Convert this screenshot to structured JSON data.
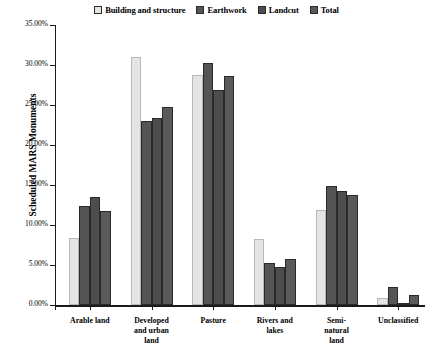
{
  "chart_data": {
    "type": "bar",
    "title": "",
    "subtitle": "",
    "xlabel": "",
    "ylabel": "Scheduled MARS Monuments",
    "ylim": [
      0,
      35
    ],
    "grid": false,
    "legend_position": "top-center",
    "y_tick_labels": [
      "0.00%",
      "5.00%",
      "10.00%",
      "15.00%",
      "20.00%",
      "25.00%",
      "30.00%",
      "35.00%"
    ],
    "y_tick_values": [
      0,
      5,
      10,
      15,
      20,
      25,
      30,
      35
    ],
    "categories": [
      "Arable land",
      "Developed and urban land",
      "Pasture",
      "Rivers and lakes",
      "Semi-natural land",
      "Unclassified"
    ],
    "category_lines": [
      [
        "Arable land"
      ],
      [
        "Developed",
        "and urban",
        "land"
      ],
      [
        "Pasture"
      ],
      [
        "Rivers and",
        "lakes"
      ],
      [
        "Semi-",
        "natural",
        "land"
      ],
      [
        "Unclassified"
      ]
    ],
    "series": [
      {
        "name": "Building and structure",
        "color": "#e4e4e4",
        "values": [
          8.4,
          31.0,
          28.7,
          8.3,
          11.9,
          0.9
        ]
      },
      {
        "name": "Earthwork",
        "color": "#555555",
        "values": [
          12.4,
          23.0,
          30.3,
          5.3,
          14.9,
          2.3
        ]
      },
      {
        "name": "Landcut",
        "color": "#4d4d4d",
        "values": [
          13.5,
          23.4,
          26.9,
          4.7,
          14.2,
          0.1
        ]
      },
      {
        "name": "Total",
        "color": "#5a5a5a",
        "values": [
          11.8,
          24.8,
          28.6,
          5.7,
          13.8,
          1.2
        ]
      }
    ]
  }
}
